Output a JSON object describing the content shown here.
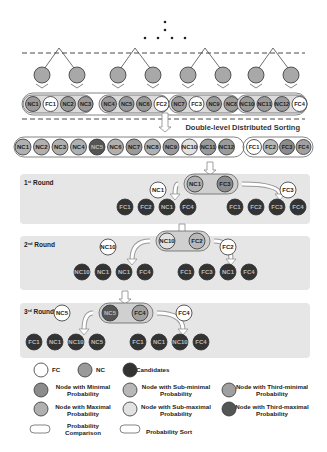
{
  "colors": {
    "fc": "#ffffff",
    "nc": "#9a9a9a",
    "candidate": "#333333",
    "min": "#8c8c8c",
    "submin": "#b8b8b8",
    "thirdmin": "#a0a0a0",
    "max": "#b0b0b0",
    "submax": "#e2e2e2",
    "thirdmax": "#555555",
    "panel": "#e6e6e6",
    "tree_node": "#a8a8a8"
  },
  "title": "Double-level Distributed Sorting",
  "top_groups": [
    {
      "nodes": [
        {
          "label": "NC1",
          "type": "nc"
        },
        {
          "label": "FC1",
          "type": "fc"
        },
        {
          "label": "NC2",
          "type": "nc"
        },
        {
          "label": "NC3",
          "type": "nc"
        }
      ]
    },
    {
      "nodes": [
        {
          "label": "NC4",
          "type": "nc"
        },
        {
          "label": "NC5",
          "type": "nc"
        },
        {
          "label": "NC6",
          "type": "nc"
        },
        {
          "label": "FC2",
          "type": "fc"
        }
      ]
    },
    {
      "nodes": [
        {
          "label": "NC7",
          "type": "nc"
        },
        {
          "label": "FC3",
          "type": "fc"
        },
        {
          "label": "NC9",
          "type": "nc"
        },
        {
          "label": "NC8",
          "type": "nc"
        }
      ]
    },
    {
      "nodes": [
        {
          "label": "NC10",
          "type": "nc"
        },
        {
          "label": "NC11",
          "type": "nc"
        },
        {
          "label": "NC12",
          "type": "nc"
        },
        {
          "label": "FC4",
          "type": "fc"
        }
      ]
    }
  ],
  "sorted_nc": [
    {
      "label": "NC1",
      "type": "max"
    },
    {
      "label": "NC2",
      "type": "max"
    },
    {
      "label": "NC3",
      "type": "max"
    },
    {
      "label": "NC4",
      "type": "max"
    },
    {
      "label": "NC5",
      "type": "thirdmax"
    },
    {
      "label": "NC6",
      "type": "max"
    },
    {
      "label": "NC7",
      "type": "nc"
    },
    {
      "label": "NC8",
      "type": "max"
    },
    {
      "label": "NC9",
      "type": "nc"
    },
    {
      "label": "NC10",
      "type": "submax"
    },
    {
      "label": "NC11",
      "type": "nc"
    },
    {
      "label": "NC12",
      "type": "nc"
    }
  ],
  "sorted_fc": [
    {
      "label": "FC1",
      "type": "fc"
    },
    {
      "label": "FC2",
      "type": "submin"
    },
    {
      "label": "FC3",
      "type": "min"
    },
    {
      "label": "FC4",
      "type": "thirdmin"
    }
  ],
  "rounds": [
    {
      "title": "1st Round",
      "sup": "st",
      "num": "1",
      "compare": [
        {
          "label": "NC1",
          "type": "max"
        },
        {
          "label": "FC3",
          "type": "min"
        }
      ],
      "left_pick": {
        "label": "NC1",
        "type": "max"
      },
      "right_pick": {
        "label": "FC3",
        "type": "min"
      },
      "left_candidates": [
        "FC1",
        "FC2",
        "NC1",
        "FC4"
      ],
      "right_candidates": [
        "FC1",
        "FC2",
        "FC3",
        "FC4"
      ]
    },
    {
      "title": "2nd Round",
      "sup": "nd",
      "num": "2",
      "compare": [
        {
          "label": "NC10",
          "type": "submax"
        },
        {
          "label": "FC2",
          "type": "submin"
        }
      ],
      "left_pick": {
        "label": "NC10",
        "type": "submax"
      },
      "right_pick": {
        "label": "FC2",
        "type": "submin"
      },
      "left_candidates": [
        "NC10",
        "NC1",
        "NC1",
        "FC4"
      ],
      "right_candidates": [
        "FC1",
        "FC3",
        "NC1",
        "FC4"
      ]
    },
    {
      "title": "3rd Round",
      "sup": "rd",
      "num": "3",
      "compare": [
        {
          "label": "NC5",
          "type": "thirdmax"
        },
        {
          "label": "FC4",
          "type": "thirdmin"
        }
      ],
      "left_pick": {
        "label": "NC5",
        "type": "fc"
      },
      "right_pick": {
        "label": "FC4",
        "type": "fc"
      },
      "left_candidates": [
        "FC1",
        "NC1",
        "NC10",
        "NC5"
      ],
      "right_candidates": [
        "FC1",
        "NC1",
        "NC10",
        "FC4"
      ]
    }
  ],
  "legend": {
    "fc": "FC",
    "nc": "NC",
    "candidates": "Candidates",
    "min": "Node with Minimal Probability",
    "submin": "Node with Sub-minimal Probability",
    "thirdmin": "Node with Third-minimal Probability",
    "max": "Node with Maximal Probability",
    "submax": "Node with Sub-maximal Probability",
    "thirdmax": "Node with Third-maximal Probability",
    "comparison": "Probability Comparison",
    "sort": "Probability Sort"
  }
}
